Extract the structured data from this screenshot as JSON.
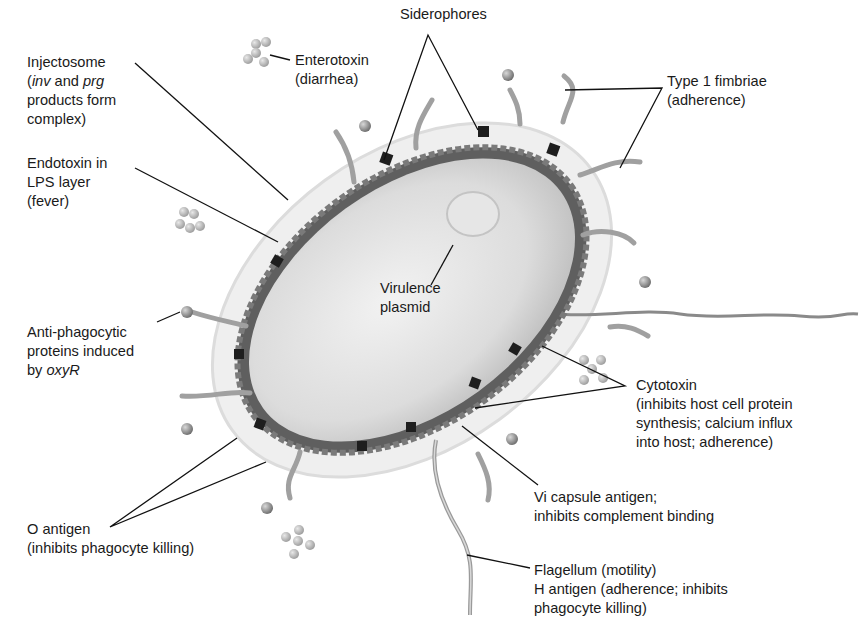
{
  "diagram": {
    "colors": {
      "background": "#ffffff",
      "cytoplasm": "#e2e2e2",
      "membrane": "#6a6a6a",
      "capsule": "#ececec",
      "fimbriae": "#9a9a9a",
      "siderophore": "#1e1e1e",
      "leader_line": "#111111",
      "text": "#1a1a1a"
    },
    "labels": {
      "injectosome": {
        "line1": "Injectosome",
        "line2_prefix": "(",
        "line2_italic1": "inv",
        "line2_mid": " and ",
        "line2_italic2": "prg",
        "line3": "products form",
        "line4": "complex)"
      },
      "enterotoxin": {
        "line1": "Enterotoxin",
        "line2": "(diarrhea)"
      },
      "siderophores": {
        "line1": "Siderophores"
      },
      "type1_fimbriae": {
        "line1": "Type 1 fimbriae",
        "line2": "(adherence)"
      },
      "endotoxin": {
        "line1": "Endotoxin in",
        "line2": "LPS layer",
        "line3": "(fever)"
      },
      "virulence_plasmid": {
        "line1": "Virulence",
        "line2": "plasmid"
      },
      "anti_phagocytic": {
        "line1": "Anti-phagocytic",
        "line2": "proteins induced",
        "line3_prefix": "by ",
        "line3_italic": "oxyR"
      },
      "cytotoxin": {
        "line1": "Cytotoxin",
        "line2": "(inhibits host cell protein",
        "line3": "synthesis; calcium influx",
        "line4": "into host; adherence)"
      },
      "vi_capsule": {
        "line1": "Vi capsule antigen;",
        "line2": "inhibits complement binding"
      },
      "o_antigen": {
        "line1": "O antigen",
        "line2": "(inhibits phagocyte killing)"
      },
      "flagellum": {
        "line1": "Flagellum (motility)",
        "line2": "H antigen (adherence; inhibits",
        "line3": "phagocyte killing)"
      }
    }
  }
}
